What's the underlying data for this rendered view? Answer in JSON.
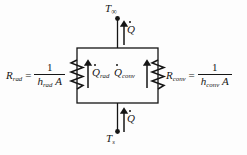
{
  "diagram": {
    "type": "thermal-resistance-network",
    "background_color": "#fdfdfd",
    "line_color": "#151515",
    "nodes": [
      {
        "id": "t-infinity",
        "label": "T",
        "subscript": "∞",
        "position": "top"
      },
      {
        "id": "t-surface",
        "label": "T",
        "subscript": "s",
        "position": "bottom"
      }
    ],
    "flows": [
      {
        "id": "q-top",
        "label": "Q",
        "subscript": "",
        "direction": "up",
        "position": "top-lead"
      },
      {
        "id": "q-bottom",
        "label": "Q",
        "subscript": "",
        "direction": "up",
        "position": "bottom-lead"
      },
      {
        "id": "q-rad",
        "label": "Q",
        "subscript": "rad",
        "direction": "up",
        "position": "left-branch"
      },
      {
        "id": "q-conv",
        "label": "Q",
        "subscript": "conv",
        "direction": "up",
        "position": "right-branch"
      }
    ],
    "resistances": [
      {
        "id": "r-rad",
        "name": "R",
        "subscript": "rad",
        "equals": "=",
        "numerator": "1",
        "denominator_h": "h",
        "denominator_sub": "rad",
        "denominator_area": "A",
        "side": "left"
      },
      {
        "id": "r-conv",
        "name": "R",
        "subscript": "conv",
        "equals": "=",
        "numerator": "1",
        "denominator_h": "h",
        "denominator_sub": "conv",
        "denominator_area": "A",
        "side": "right"
      }
    ]
  }
}
